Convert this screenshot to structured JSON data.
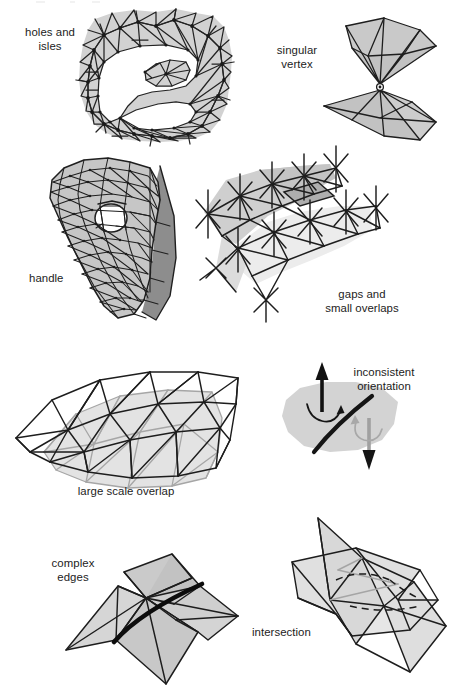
{
  "figure": {
    "background_color": "#ffffff",
    "ink_color": "#1c1c1c",
    "fill_light": "#d4d4d4",
    "fill_mid": "#bcbcbc",
    "fill_dark": "#8e8e8e",
    "ghost_color": "#a8a8a8"
  },
  "panels": [
    {
      "id": "holes-and-isles",
      "caption": "holes and\nisles",
      "caption_align": "center",
      "description": "Irregular triangulated patch containing a large interior hole and a small detached island of triangles."
    },
    {
      "id": "singular-vertex",
      "caption": "singular\nvertex",
      "caption_align": "center",
      "description": "Two triangle fans joined at exactly one shared point."
    },
    {
      "id": "handle",
      "caption": "handle",
      "caption_align": "left",
      "description": "Curved triangulated surface pierced by a round hole, forming a handle; shaded back-face visible along the right rim."
    },
    {
      "id": "gaps-and-small-overlaps",
      "caption": "gaps and\nsmall overlaps",
      "caption_align": "center",
      "description": "Two triangle strips that neither meet nor match: small cracks and slight overlapping along the seam."
    },
    {
      "id": "large-scale-overlap",
      "caption": "large scale overlap",
      "caption_align": "center",
      "description": "Two complete meshes of the same region offset from each other, drawn in black and gray."
    },
    {
      "id": "inconsistent-orientation",
      "caption": "inconsistent\norientation",
      "caption_align": "center",
      "description": "A surface patch split by a thick curve; the left half points its normal up, the right half points down."
    },
    {
      "id": "complex-edges",
      "caption": "complex\nedges",
      "caption_align": "center",
      "description": "More than two triangles incident on one thick highlighted edge."
    },
    {
      "id": "intersection",
      "caption": "intersection",
      "caption_align": "left",
      "description": "Two triangle fans passing through one another; hidden intersection curve drawn dashed."
    }
  ],
  "top_edge_artifacts": [
    "ink-fragment-1",
    "ink-fragment-2",
    "ink-fragment-3"
  ]
}
